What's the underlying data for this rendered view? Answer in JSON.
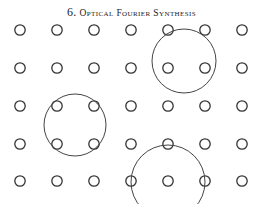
{
  "header": {
    "number": "6.",
    "title": "Optical Fourier Synthesis"
  },
  "diagram": {
    "type": "lattice-with-aperture-circles",
    "lattice": {
      "columns_x": [
        20,
        57,
        94,
        131,
        168,
        205,
        242
      ],
      "rows_y": [
        30,
        68,
        106,
        144,
        181
      ],
      "dot_radius": 5.2,
      "stroke": "#333333"
    },
    "circles": [
      {
        "label": "upper-right-aperture",
        "cx": 184,
        "cy": 61,
        "r": 32
      },
      {
        "label": "left-aperture",
        "cx": 75,
        "cy": 125,
        "r": 31
      },
      {
        "label": "bottom-aperture",
        "cx": 168,
        "cy": 182,
        "r": 37
      }
    ]
  }
}
